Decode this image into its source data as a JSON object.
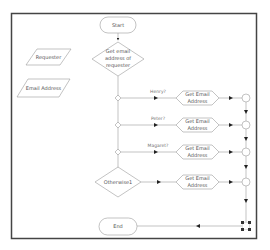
{
  "diagram": {
    "type": "flowchart",
    "frame": {
      "border_color": "#444444"
    },
    "data_objects": [
      {
        "label": "Requester"
      },
      {
        "label": "Email Address"
      }
    ],
    "start": {
      "label": "Start"
    },
    "main_decision": {
      "lines": [
        "Get email",
        "address of",
        "requester"
      ]
    },
    "branches": [
      {
        "condition": "Henry?",
        "action_lines": [
          "Get Email",
          "Address"
        ]
      },
      {
        "condition": "Peter?",
        "action_lines": [
          "Get Email",
          "Address"
        ]
      },
      {
        "condition": "Magaret?",
        "action_lines": [
          "Get Email",
          "Address"
        ]
      }
    ],
    "otherwise": {
      "label": "Otherwise1",
      "action_lines": [
        "Get Email",
        "Address"
      ]
    },
    "end": {
      "label": "End"
    },
    "colors": {
      "stroke": "#9a9a9a",
      "arrow": "#222222",
      "text": "#555555"
    }
  }
}
